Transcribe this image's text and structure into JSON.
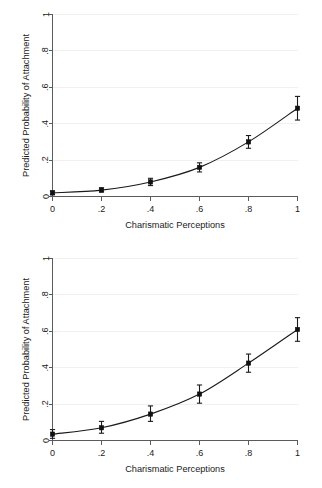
{
  "figure": {
    "panel_count": 2
  },
  "chart_data": [
    {
      "type": "line",
      "title": "",
      "subtitle": "",
      "xlabel": "Charismatic Perceptions",
      "ylabel": "Predicted Probability of Attachment",
      "x": [
        0,
        0.2,
        0.4,
        0.6,
        0.8,
        1
      ],
      "values": [
        0.02,
        0.035,
        0.08,
        0.16,
        0.3,
        0.485
      ],
      "error_low": [
        0.01,
        0.025,
        0.06,
        0.135,
        0.265,
        0.42
      ],
      "error_high": [
        0.03,
        0.048,
        0.1,
        0.185,
        0.335,
        0.55
      ],
      "xticklabels": [
        "0",
        ".2",
        ".4",
        ".6",
        ".8",
        "1"
      ],
      "yticklabels": [
        "0",
        ".2",
        ".4",
        ".6",
        ".8",
        "1"
      ],
      "xticks": [
        0,
        0.2,
        0.4,
        0.6,
        0.8,
        1
      ],
      "yticks": [
        0,
        0.2,
        0.4,
        0.6,
        0.8,
        1
      ],
      "xlim": [
        0,
        1
      ],
      "ylim": [
        0,
        1
      ],
      "grid": true,
      "legend": "none",
      "marker": "square",
      "line_color": "#1a1a1a"
    },
    {
      "type": "line",
      "title": "",
      "subtitle": "",
      "xlabel": "Charismatic Perceptions",
      "ylabel": "Predicted Probability of Attachment",
      "x": [
        0,
        0.2,
        0.4,
        0.6,
        0.8,
        1
      ],
      "values": [
        0.035,
        0.07,
        0.145,
        0.255,
        0.425,
        0.61
      ],
      "error_low": [
        0.012,
        0.04,
        0.105,
        0.205,
        0.375,
        0.545
      ],
      "error_high": [
        0.06,
        0.105,
        0.19,
        0.305,
        0.475,
        0.675
      ],
      "xticklabels": [
        "0",
        ".2",
        ".4",
        ".6",
        ".8",
        "1"
      ],
      "yticklabels": [
        "0",
        ".2",
        ".4",
        ".6",
        ".8",
        "1"
      ],
      "xticks": [
        0,
        0.2,
        0.4,
        0.6,
        0.8,
        1
      ],
      "yticks": [
        0,
        0.2,
        0.4,
        0.6,
        0.8,
        1
      ],
      "xlim": [
        0,
        1
      ],
      "ylim": [
        0,
        1
      ],
      "grid": true,
      "legend": "none",
      "marker": "square",
      "line_color": "#1a1a1a"
    }
  ]
}
